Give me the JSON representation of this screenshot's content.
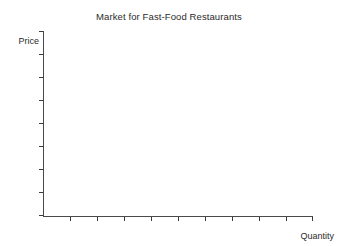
{
  "figure": {
    "width": 338,
    "height": 246,
    "background_color": "#ffffff",
    "axis_color": "#4a4a4a",
    "tick_color": "#3a3a3a",
    "text_color": "#2b2b2b"
  },
  "chart_data": {
    "type": "line",
    "title": "Market for Fast-Food Restaurants",
    "subtitle": "",
    "xlabel": "Quantity",
    "ylabel": "Price",
    "series": [],
    "categories": [],
    "x": [],
    "values": [],
    "annotations": [],
    "legend": {
      "entries": [],
      "position": "none"
    },
    "grid": false,
    "xlim": [
      0,
      10
    ],
    "ylim": [
      0,
      8
    ],
    "xtick_labels": [],
    "ytick_labels": [],
    "xtick_count": 10,
    "ytick_count": 9
  },
  "axes": {
    "title": "Market for Fast-Food Restaurants",
    "y_label": "Price",
    "x_label": "Quantity",
    "y_ticks": [
      31,
      54,
      77,
      100,
      123,
      146,
      169,
      192,
      215
    ],
    "x_ticks": [
      70,
      97,
      124,
      151,
      178,
      205,
      232,
      259,
      286,
      312
    ]
  }
}
